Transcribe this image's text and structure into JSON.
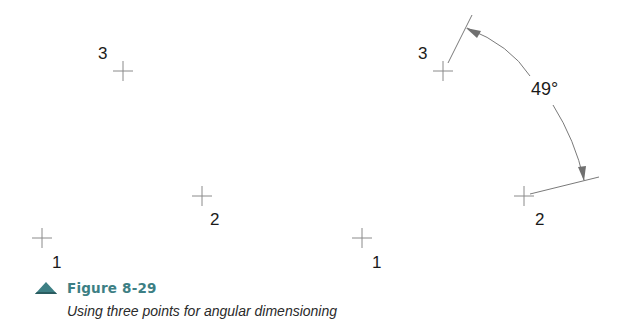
{
  "figure": {
    "number": "Figure 8-29",
    "caption": "Using three points for angular dimensioning",
    "accent_color": "#3d7f84"
  },
  "left_drawing": {
    "points": [
      {
        "label": "1",
        "x": 42,
        "y": 238
      },
      {
        "label": "2",
        "x": 202,
        "y": 196
      },
      {
        "label": "3",
        "x": 123,
        "y": 71
      }
    ]
  },
  "right_drawing": {
    "points": [
      {
        "label": "1",
        "x": 362,
        "y": 238
      },
      {
        "label": "2",
        "x": 524,
        "y": 196
      },
      {
        "label": "3",
        "x": 443,
        "y": 71
      }
    ],
    "angular_dimension": {
      "value": "49°",
      "vertex_point": "1",
      "extension_points": [
        "2",
        "3"
      ]
    }
  }
}
